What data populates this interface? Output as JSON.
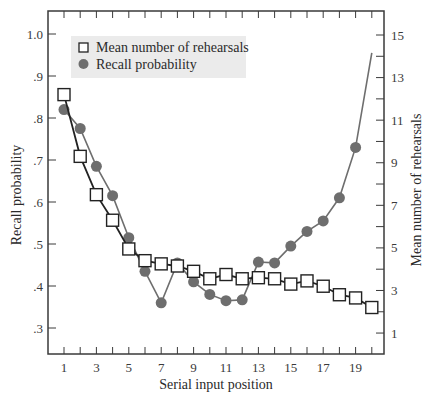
{
  "chart_data": {
    "type": "line",
    "title": "",
    "xlabel": "Serial input position",
    "ylabel": "Recall probability",
    "ylabel_right": "Mean number of rehearsals",
    "x": [
      1,
      2,
      3,
      4,
      5,
      6,
      7,
      8,
      9,
      10,
      11,
      12,
      13,
      14,
      15,
      16,
      17,
      18,
      19,
      20
    ],
    "x_tick_labels": [
      "1",
      "3",
      "5",
      "7",
      "9",
      "11",
      "13",
      "15",
      "17",
      "19"
    ],
    "y_tick_labels": [
      "1.0",
      ".9",
      ".8",
      ".7",
      ".6",
      ".5",
      ".4",
      ".3"
    ],
    "y_right_tick_labels": [
      "15",
      "13",
      "11",
      "9",
      "7",
      "5",
      "3",
      "1"
    ],
    "ylim": [
      0.25,
      1.05
    ],
    "ylim_right": [
      0,
      16
    ],
    "xlim": [
      0,
      21
    ],
    "grid": false,
    "legend_position": "upper-left",
    "series": [
      {
        "name": "Mean number of rehearsals",
        "axis": "right",
        "marker": "square-open",
        "color": "#222222",
        "values": [
          12.2,
          9.3,
          7.5,
          6.3,
          4.95,
          4.4,
          4.25,
          4.15,
          3.9,
          3.55,
          3.75,
          3.55,
          3.6,
          3.55,
          3.3,
          3.45,
          3.2,
          2.8,
          2.65,
          2.2
        ]
      },
      {
        "name": "Recall probability",
        "axis": "left",
        "marker": "circle-filled",
        "color": "#6e6e6e",
        "values": [
          0.82,
          0.775,
          0.685,
          0.615,
          0.515,
          0.435,
          0.36,
          0.455,
          0.41,
          0.38,
          0.365,
          0.367,
          0.457,
          0.455,
          0.495,
          0.53,
          0.555,
          0.61,
          0.73,
          0.955
        ],
        "last_point_marker": false
      }
    ]
  },
  "legend": {
    "items": [
      {
        "label": "Mean number of rehearsals",
        "icon": "open-square-icon"
      },
      {
        "label": "Recall probability",
        "icon": "filled-circle-icon"
      }
    ],
    "background": "#ebebeb"
  },
  "colors": {
    "axis": "#3a3a3a",
    "rehearsals_line": "#222222",
    "recall_line": "#6e6e6e"
  }
}
